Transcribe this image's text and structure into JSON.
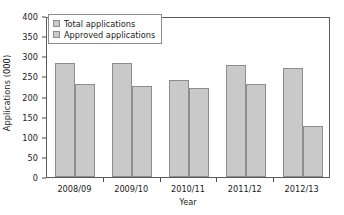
{
  "chart_data": {
    "type": "bar",
    "title": "",
    "xlabel": "Year",
    "ylabel": "Applications (000)",
    "categories": [
      "2008/09",
      "2009/10",
      "2010/11",
      "2011/12",
      "2012/13"
    ],
    "series": [
      {
        "name": "Total applications",
        "values": [
          283,
          283,
          242,
          278,
          272
        ]
      },
      {
        "name": "Approved applications",
        "values": [
          230,
          227,
          222,
          230,
          126
        ]
      }
    ],
    "ylim": [
      0,
      400
    ],
    "yticks": [
      0,
      50,
      100,
      150,
      200,
      250,
      300,
      350,
      400
    ],
    "ytick_labels": [
      "0",
      "50",
      "100",
      "150",
      "200",
      "250",
      "300",
      "350",
      "400"
    ],
    "grid": false,
    "legend_position": "upper left",
    "bar_color": "#c9c9c9",
    "bar_border_color": "#8d8d8d",
    "axis_color": "#5a5a5a",
    "background": "#ffffff"
  }
}
